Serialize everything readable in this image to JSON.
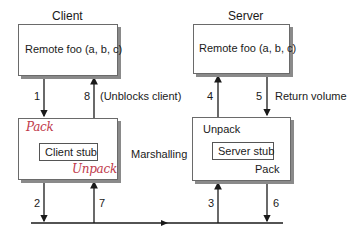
{
  "client": {
    "title": "Client",
    "procedure_box": "Remote foo (a, b, c)",
    "stub_box": "Client stub",
    "stub_annotation_top": "Pack",
    "stub_annotation_bottom": "Unpack"
  },
  "server": {
    "title": "Server",
    "procedure_box": "Remote foo (a, b, c)",
    "stub_box": "Server stub",
    "stub_annotation_top": "Unpack",
    "stub_annotation_bottom": "Pack"
  },
  "middle_label": "Marshalling",
  "steps": {
    "s1": "1",
    "s2": "2",
    "s3": "3",
    "s4": "4",
    "s5": "5",
    "s6": "6",
    "s7": "7",
    "s8": "8"
  },
  "step_notes": {
    "s8": "(Unblocks client)",
    "s5": "Return volume"
  },
  "colors": {
    "line": "#1a1a1a",
    "box_border": "#6a6a6a",
    "box_shadow": "#8a8a8a",
    "handwriting": "#c0394a"
  }
}
